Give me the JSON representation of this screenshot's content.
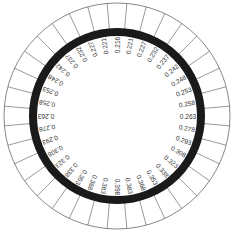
{
  "diagram": {
    "type": "circular-ring-diagram",
    "center": [
      117,
      116
    ],
    "outer_ring": {
      "radius_outer": 113,
      "radius_inner": 87,
      "segments": 36,
      "stroke": "#555555"
    },
    "thick_ring": {
      "radius": 84,
      "width": 8,
      "color": "#1a1a1a"
    },
    "labels_start_angle_deg": 0,
    "labels_direction": "clockwise",
    "labels": [
      "0.216",
      "0.221",
      "0.227",
      "0.232",
      "0.237",
      "0.242",
      "0.248",
      "0.253",
      "0.258",
      "0.263",
      "0.278",
      "0.293",
      "0.308",
      "0.323",
      "0.338",
      "0.353",
      "0.368",
      "0.383",
      "0.398",
      "0.383",
      "0.368",
      "0.353",
      "0.338",
      "0.323",
      "0.308",
      "0.293",
      "0.278",
      "0.263",
      "0.258",
      "0.253",
      "0.248",
      "0.242",
      "0.237",
      "0.232",
      "0.227",
      "0.221"
    ]
  }
}
